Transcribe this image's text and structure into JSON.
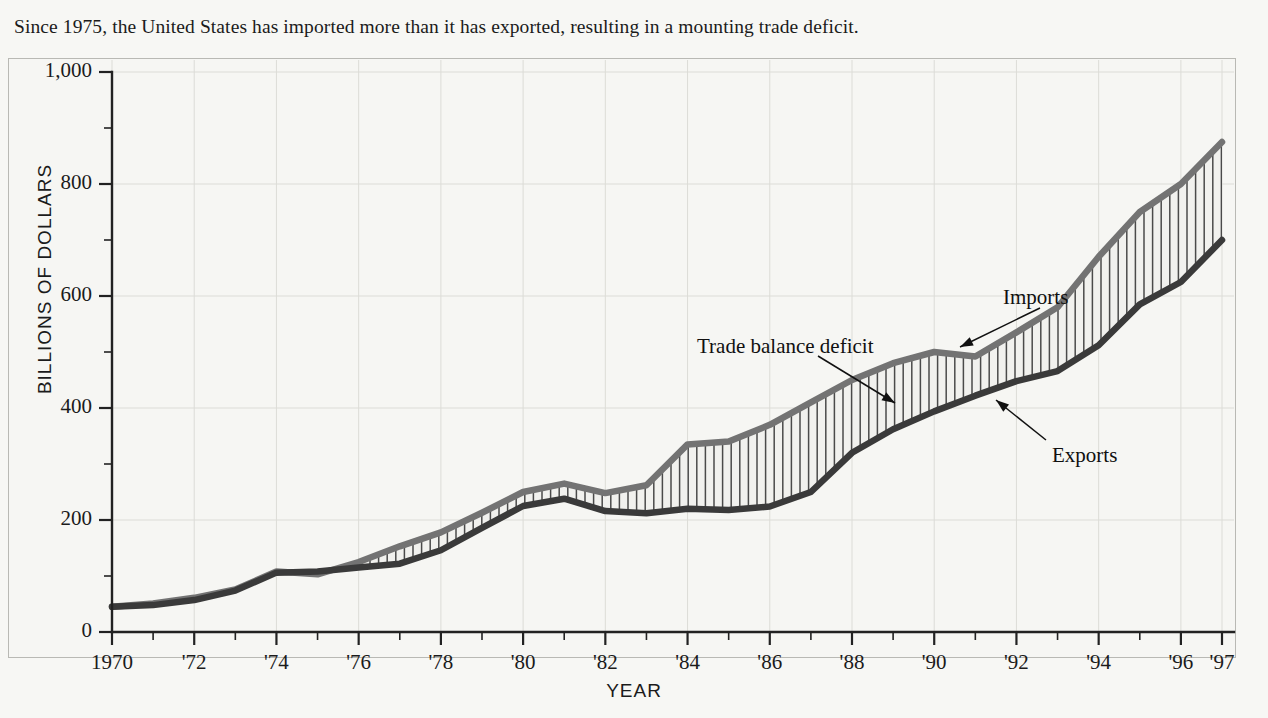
{
  "caption": "Since 1975, the United States has imported more than it has exported, resulting in a mounting trade deficit.",
  "axes": {
    "y_title": "BILLIONS OF DOLLARS",
    "x_title": "YEAR"
  },
  "annotations": {
    "imports": "Imports",
    "deficit": "Trade balance deficit",
    "exports": "Exports"
  },
  "colors": {
    "imports_line": "#737373",
    "exports_line": "#3a3a3a",
    "hatch": "#4a4a4a",
    "band_fill": "#f1f1ee",
    "background": "#f7f7f4",
    "frame": "#b9b9b4",
    "gridline": "#dcdcd7",
    "axis": "#222222",
    "text": "#1b1b1b"
  },
  "chart_data": {
    "type": "area",
    "title": "",
    "subtitle": "",
    "xlabel": "YEAR",
    "ylabel": "BILLIONS OF DOLLARS",
    "xlim": [
      1970,
      1997
    ],
    "ylim": [
      0,
      1000
    ],
    "grid": true,
    "legend_position": "inline-annotations",
    "y_ticks": [
      0,
      200,
      400,
      600,
      800,
      1000
    ],
    "y_tick_labels": [
      "0",
      "200",
      "400",
      "600",
      "800",
      "1,000"
    ],
    "y_minor_tick_interval": 100,
    "x_ticks": [
      1970,
      1971,
      1972,
      1973,
      1974,
      1975,
      1976,
      1977,
      1978,
      1979,
      1980,
      1981,
      1982,
      1983,
      1984,
      1985,
      1986,
      1987,
      1988,
      1989,
      1990,
      1991,
      1992,
      1993,
      1994,
      1995,
      1996,
      1997
    ],
    "x_tick_labels": [
      "1970",
      "'72",
      "'74",
      "'76",
      "'78",
      "'80",
      "'82",
      "'84",
      "'86",
      "'88",
      "'90",
      "'92",
      "'94",
      "'96",
      "'97"
    ],
    "x_tick_label_years": [
      1970,
      1972,
      1974,
      1976,
      1978,
      1980,
      1982,
      1984,
      1986,
      1988,
      1990,
      1992,
      1994,
      1996,
      1997
    ],
    "x": [
      1970,
      1971,
      1972,
      1973,
      1974,
      1975,
      1976,
      1977,
      1978,
      1979,
      1980,
      1981,
      1982,
      1983,
      1984,
      1985,
      1986,
      1987,
      1988,
      1989,
      1990,
      1991,
      1992,
      1993,
      1994,
      1995,
      1996,
      1997
    ],
    "series": [
      {
        "name": "Imports",
        "color": "#737373",
        "values": [
          45,
          51,
          61,
          76,
          108,
          103,
          125,
          153,
          178,
          213,
          250,
          265,
          248,
          262,
          335,
          340,
          370,
          410,
          450,
          480,
          500,
          492,
          535,
          580,
          670,
          750,
          800,
          875
        ]
      },
      {
        "name": "Exports",
        "color": "#3a3a3a",
        "values": [
          45,
          48,
          57,
          74,
          106,
          108,
          115,
          122,
          146,
          186,
          225,
          238,
          216,
          212,
          220,
          218,
          224,
          250,
          320,
          362,
          394,
          422,
          448,
          466,
          512,
          585,
          625,
          700
        ]
      }
    ],
    "band": {
      "name": "Trade balance deficit",
      "between": [
        "Imports",
        "Exports"
      ],
      "fill": "#f1f1ee",
      "hatch_style": "vertical-lines"
    }
  }
}
